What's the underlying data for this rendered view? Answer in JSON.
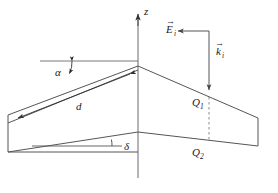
{
  "figure": {
    "kind": "wedge-scattering-geometry-diagram",
    "background_color": "#ffffff",
    "line_color": "#555555",
    "axis_color": "#6b6b6b",
    "text_color": "#1a1a1a",
    "dashed_color": "#8a8a8a"
  },
  "axis": {
    "z_label": "z",
    "arrow_direction": "up"
  },
  "labels": {
    "alpha": "α",
    "delta": "δ",
    "d": "d",
    "E_symbol": "E",
    "E_sub": "i",
    "E_accent": "→",
    "k_symbol": "k",
    "k_sub": "i",
    "k_accent": "→",
    "Q1_symbol": "Q",
    "Q1_sub": "1",
    "Q2_symbol": "Q",
    "Q2_sub": "2"
  },
  "icons": {
    "z_axis_arrow": "arrow-up-icon",
    "k_vector_arrow": "arrow-down-icon",
    "E_vector_arrow": "arrow-left-icon",
    "d_arrow_left": "arrow-left-icon",
    "d_arrow_right": "arrow-right-icon",
    "alpha_arc_arrow": "double-arrow-arc-icon",
    "dashed_connector": "dashed-line-icon"
  },
  "geometry": {
    "apex_x": 138,
    "apex_y": 66,
    "z_axis_top_y": 14,
    "z_axis_bottom_y": 178,
    "left_far_x": 8,
    "right_far_x": 258,
    "upper_left_end_y": 123,
    "lower_left_end_y": 152,
    "upper_right_end_y": 118,
    "lower_right_end_y": 146,
    "baseline_apex_y": 132,
    "dashed_x": 209,
    "ref_line_left_x": 40,
    "ref_line_y": 61
  }
}
